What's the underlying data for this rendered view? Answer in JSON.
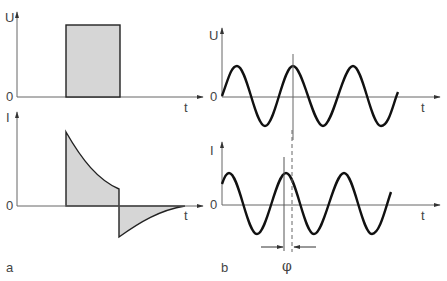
{
  "figure": {
    "panel_a": {
      "label": "a",
      "top_plot": {
        "y_axis_label": "U",
        "origin_label": "0",
        "x_axis_label": "t",
        "signal": "rectangular voltage pulse"
      },
      "bottom_plot": {
        "y_axis_label": "I",
        "origin_label": "0",
        "x_axis_label": "t",
        "signal": "exponentially decaying charge/discharge current"
      }
    },
    "panel_b": {
      "label": "b",
      "top_plot": {
        "y_axis_label": "U",
        "origin_label": "0",
        "x_axis_label": "t",
        "signal": "sinusoidal voltage"
      },
      "bottom_plot": {
        "y_axis_label": "I",
        "origin_label": "0",
        "x_axis_label": "t",
        "signal": "sinusoidal current (leading)"
      },
      "phase_label": "φ"
    },
    "colors": {
      "fill": "#d6d6d6",
      "curve": "#111111",
      "axis": "#666666"
    }
  }
}
